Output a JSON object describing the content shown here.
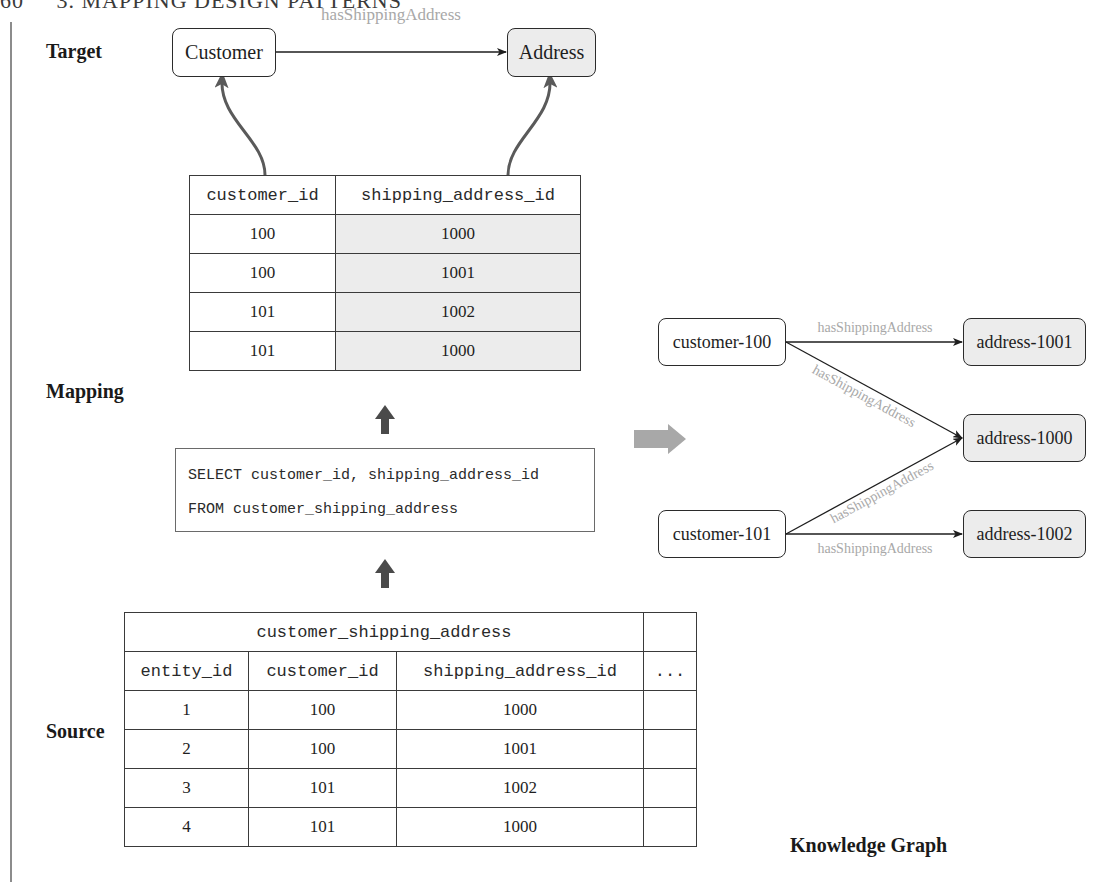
{
  "page": {
    "running_head": "60     3. MAPPING DESIGN PATTERNS"
  },
  "labels": {
    "target": "Target",
    "mapping": "Mapping",
    "source": "Source",
    "knowledge_graph": "Knowledge Graph"
  },
  "target": {
    "nodes": [
      {
        "id": "customer",
        "label": "Customer",
        "fill": "#ffffff"
      },
      {
        "id": "address",
        "label": "Address",
        "fill": "#ececec"
      }
    ],
    "edge_label": "hasShippingAddress"
  },
  "mapping_table": {
    "headers": [
      "customer_id",
      "shipping_address_id"
    ],
    "rows": [
      [
        "100",
        "1000"
      ],
      [
        "100",
        "1001"
      ],
      [
        "101",
        "1002"
      ],
      [
        "101",
        "1000"
      ]
    ]
  },
  "sql": {
    "line1": "SELECT customer_id, shipping_address_id",
    "line2": "FROM customer_shipping_address"
  },
  "source_table": {
    "name": "customer_shipping_address",
    "headers": [
      "entity_id",
      "customer_id",
      "shipping_address_id",
      "..."
    ],
    "rows": [
      [
        "1",
        "100",
        "1000",
        ""
      ],
      [
        "2",
        "100",
        "1001",
        ""
      ],
      [
        "3",
        "101",
        "1002",
        ""
      ],
      [
        "4",
        "101",
        "1000",
        ""
      ]
    ]
  },
  "knowledge_graph": {
    "nodes": [
      {
        "id": "customer-100",
        "label": "customer-100"
      },
      {
        "id": "customer-101",
        "label": "customer-101"
      },
      {
        "id": "address-1001",
        "label": "address-1001"
      },
      {
        "id": "address-1000",
        "label": "address-1000"
      },
      {
        "id": "address-1002",
        "label": "address-1002"
      }
    ],
    "edges": [
      {
        "from": "customer-100",
        "to": "address-1001",
        "label": "hasShippingAddress"
      },
      {
        "from": "customer-100",
        "to": "address-1000",
        "label": "hasShippingAddress"
      },
      {
        "from": "customer-101",
        "to": "address-1000",
        "label": "hasShippingAddress"
      },
      {
        "from": "customer-101",
        "to": "address-1002",
        "label": "hasShippingAddress"
      }
    ]
  },
  "colors": {
    "node_border": "#2b2b2b",
    "address_fill": "#ececec",
    "edge_label": "#a8a8a8",
    "flow_arrow": "#5a5a5a",
    "transform_arrow": "#a8a8a8"
  }
}
